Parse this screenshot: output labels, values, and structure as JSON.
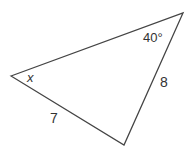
{
  "diagram": {
    "type": "triangle",
    "vertices": {
      "left": {
        "x": 11,
        "y": 76
      },
      "top_right": {
        "x": 183,
        "y": 13
      },
      "bottom": {
        "x": 124,
        "y": 145
      }
    },
    "labels": {
      "angle_left": "x",
      "angle_top_right": "40°",
      "side_bottom_left": "7",
      "side_right": "8"
    },
    "stroke_color": "#444444"
  }
}
